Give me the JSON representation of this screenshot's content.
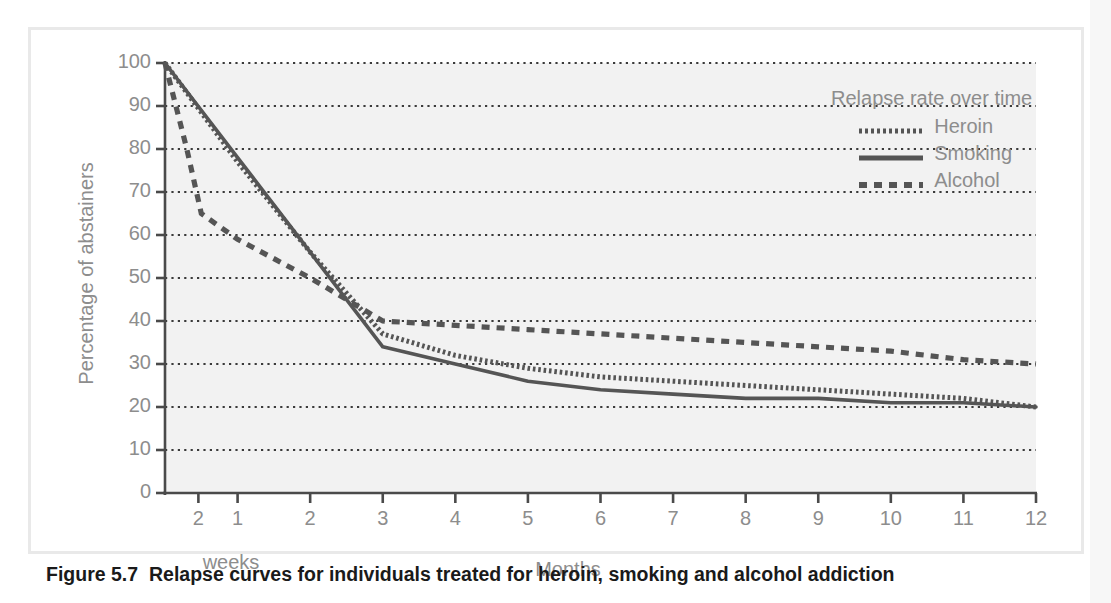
{
  "figure": {
    "caption_label": "Figure 5.7",
    "caption_text": "Relapse curves for individuals treated for heroin, smoking and alcohol addiction"
  },
  "legend": {
    "title": "Relapse rate over time",
    "entries": [
      {
        "label": "Heroin",
        "style": "fine-dotted"
      },
      {
        "label": "Smoking",
        "style": "solid"
      },
      {
        "label": "Alcohol",
        "style": "dashed"
      }
    ]
  },
  "axes": {
    "ylabel": "Percentage of abstainers",
    "xlabel_months": "Months",
    "xlabel_weeks": "weeks",
    "ytick_labels": [
      "100",
      "90",
      "80",
      "70",
      "60",
      "50",
      "40",
      "30",
      "20",
      "10",
      "0"
    ],
    "xtick_labels": [
      "2",
      "1",
      "2",
      "3",
      "4",
      "5",
      "6",
      "7",
      "8",
      "9",
      "10",
      "11",
      "12"
    ]
  },
  "colors": {
    "plot_background": "#f2f2f2",
    "grid": "#3a3a3a",
    "axis": "#4a4a4a",
    "curve": "#555555",
    "tick_text": "#8d8d8d",
    "frame": "#e9e9e9",
    "caption_text": "#1a1a1a"
  },
  "chart_data": {
    "type": "line",
    "title": "Relapse rate over time",
    "xlabel": "Months",
    "ylabel": "Percentage of abstainers",
    "xlim": [
      0,
      12
    ],
    "ylim": [
      0,
      100
    ],
    "grid": true,
    "legend_position": "top-right",
    "x_tick_values": [
      0,
      0.46,
      1,
      2,
      3,
      4,
      5,
      6,
      7,
      8,
      9,
      10,
      11,
      12
    ],
    "x_tick_labels": [
      "",
      "2 weeks",
      "1",
      "2",
      "3",
      "4",
      "5",
      "6",
      "7",
      "8",
      "9",
      "10",
      "11",
      "12"
    ],
    "y_tick_values": [
      0,
      10,
      20,
      30,
      40,
      50,
      60,
      70,
      80,
      90,
      100
    ],
    "note": "x axis begins at time 0; first labelled tick is 2 weeks, remaining ticks are months 1-12",
    "series": [
      {
        "name": "Heroin",
        "style": "fine-dotted",
        "x": [
          0,
          1,
          2,
          3,
          4,
          5,
          6,
          7,
          8,
          9,
          10,
          11,
          12
        ],
        "y": [
          100,
          77,
          56,
          37,
          32,
          29,
          27,
          26,
          25,
          24,
          23,
          22,
          20
        ]
      },
      {
        "name": "Smoking",
        "style": "solid",
        "x": [
          0,
          1,
          2,
          3,
          4,
          5,
          6,
          7,
          8,
          9,
          10,
          11,
          12
        ],
        "y": [
          100,
          78,
          56,
          34,
          30,
          26,
          24,
          23,
          22,
          22,
          21,
          21,
          20
        ]
      },
      {
        "name": "Alcohol",
        "style": "dashed",
        "x": [
          0,
          0.3,
          0.5,
          1,
          2,
          3,
          4,
          5,
          6,
          7,
          8,
          9,
          10,
          11,
          12
        ],
        "y": [
          100,
          80,
          65,
          59,
          50,
          40,
          39,
          38,
          37,
          36,
          35,
          34,
          33,
          31,
          30
        ]
      }
    ]
  }
}
